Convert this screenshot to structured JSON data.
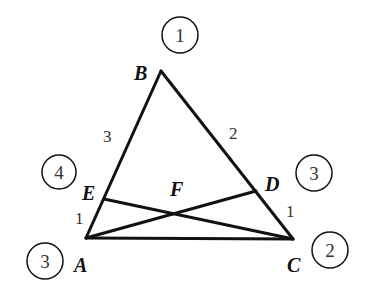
{
  "diagram": {
    "type": "triangle-mass-points",
    "vertices": {
      "A": {
        "label": "A",
        "x": 86,
        "y": 238
      },
      "B": {
        "label": "B",
        "x": 161,
        "y": 71
      },
      "C": {
        "label": "C",
        "x": 293,
        "y": 239
      },
      "D": {
        "label": "D",
        "x": 256,
        "y": 191
      },
      "E": {
        "label": "E",
        "x": 104,
        "y": 199
      },
      "F": {
        "label": "F",
        "x": 176,
        "y": 214
      }
    },
    "segments": [
      {
        "from": "A",
        "to": "B"
      },
      {
        "from": "B",
        "to": "C"
      },
      {
        "from": "A",
        "to": "C"
      },
      {
        "from": "A",
        "to": "D"
      },
      {
        "from": "E",
        "to": "C"
      }
    ],
    "segment_labels": [
      {
        "id": "BE",
        "text": "3"
      },
      {
        "id": "EA",
        "text": "1"
      },
      {
        "id": "BD",
        "text": "2"
      },
      {
        "id": "DC",
        "text": "1"
      }
    ],
    "mass_points": [
      {
        "id": "B",
        "value": "1"
      },
      {
        "id": "E",
        "value": "4"
      },
      {
        "id": "A",
        "value": "3"
      },
      {
        "id": "D",
        "value": "3"
      },
      {
        "id": "C",
        "value": "2"
      }
    ]
  }
}
